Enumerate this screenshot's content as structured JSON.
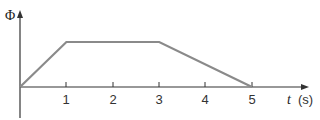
{
  "chart_data": {
    "type": "line",
    "title": "",
    "xlabel": "t (s)",
    "xlabel_var": "t",
    "xlabel_unit": "(s)",
    "ylabel": "Φ",
    "x": [
      0,
      1,
      3,
      5
    ],
    "series": [
      {
        "name": "Φ(t)",
        "values": [
          0,
          1,
          1,
          0
        ]
      }
    ],
    "xticks": [
      "1",
      "2",
      "3",
      "4",
      "5"
    ],
    "xlim": [
      0,
      5.9
    ],
    "ylim": [
      0,
      1.3
    ],
    "grid": false,
    "legend": "none",
    "colors": {
      "line": "#8a8a8a",
      "axis": "#333333"
    }
  }
}
